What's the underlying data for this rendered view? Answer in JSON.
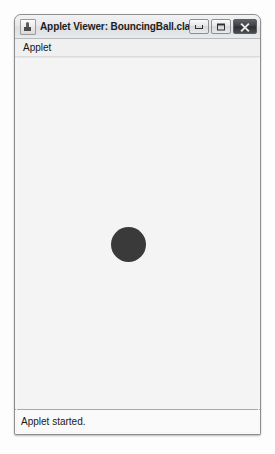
{
  "window": {
    "title": "Applet Viewer: BouncingBall.class",
    "app_icon": "java-applet-icon",
    "controls": {
      "minimize_label": "Minimize",
      "maximize_label": "Maximize",
      "close_label": "Close"
    }
  },
  "menubar": {
    "items": [
      {
        "label": "Applet"
      }
    ]
  },
  "canvas": {
    "background_color": "#f4f4f4",
    "ball": {
      "name": "bouncing-ball",
      "color": "#3a3a3a",
      "diameter_px": 35,
      "center_x_px": 113,
      "center_y_px": 186
    }
  },
  "statusbar": {
    "message": "Applet started."
  },
  "colors": {
    "window_border": "#8e8e8e",
    "titlebar_text": "#1d1d1d",
    "close_button_bg": "#3b3d42",
    "page_background": "#ffffff"
  }
}
